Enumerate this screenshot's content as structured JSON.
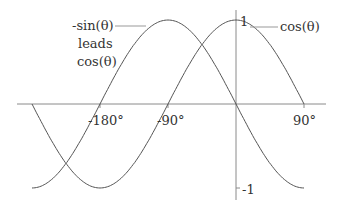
{
  "chart_data": {
    "type": "line",
    "title": "",
    "xlabel": "θ",
    "ylabel": "",
    "x_ticks": [
      "-180°",
      "-90°",
      "90°"
    ],
    "y_ticks": [
      "1",
      "-1"
    ],
    "xlim": [
      -270,
      90
    ],
    "ylim": [
      -1,
      1
    ],
    "grid": false,
    "series": [
      {
        "name": "cos(θ)",
        "x": [
          -270,
          -180,
          -90,
          0,
          90
        ],
        "values": [
          0,
          -1,
          0,
          1,
          0
        ]
      },
      {
        "name": "-sin(θ)",
        "x": [
          -270,
          -180,
          -90,
          0,
          90
        ],
        "values": [
          -1,
          0,
          1,
          0,
          -1
        ]
      }
    ],
    "annotations": [
      "-sin(θ) leads cos(θ)",
      "cos(θ)"
    ]
  },
  "labels": {
    "neg_sin_line1": "-sin(θ)",
    "neg_sin_line2": "leads",
    "neg_sin_line3": "cos(θ)",
    "cos": "cos(θ)",
    "tick_neg180": "-180°",
    "tick_neg90": "-90°",
    "tick_90": "90°",
    "tick_y1": "1",
    "tick_ym1": "-1"
  },
  "colors": {
    "curve": "#555555",
    "axis": "#888888",
    "text": "#333333"
  }
}
